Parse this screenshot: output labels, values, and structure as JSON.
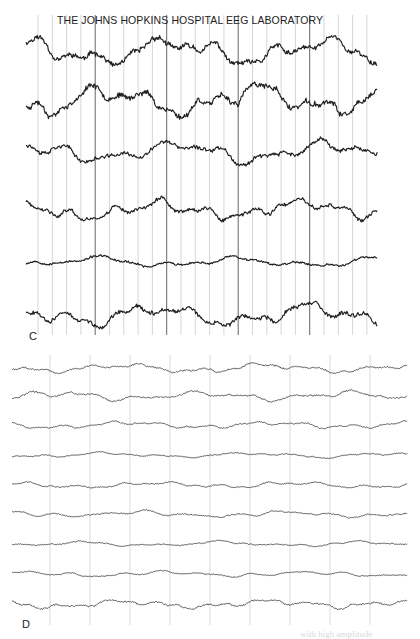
{
  "figure": {
    "header": "THE JOHNS HOPKINS HOSPITAL EEG LABORATORY",
    "caption_fragment": "with high amplitude"
  },
  "panels": [
    {
      "id": "C",
      "label": "C",
      "x_start": 26,
      "x_end": 378,
      "grid": {
        "x_first": 38,
        "spacing": 14.3,
        "x_last": 370,
        "y_top": 15,
        "y_bottom": 335,
        "dark_every": 5,
        "dark_offset": 4,
        "light_color": "#b8b8b8",
        "dark_color": "#555555"
      },
      "trace_color": "#1e1e1e",
      "trace_width": 1.15,
      "channels": [
        {
          "baseline": 52,
          "amplitude": 16,
          "seed": 11
        },
        {
          "baseline": 100,
          "amplitude": 17,
          "seed": 23
        },
        {
          "baseline": 152,
          "amplitude": 12,
          "seed": 37
        },
        {
          "baseline": 210,
          "amplitude": 11,
          "seed": 41
        },
        {
          "baseline": 262,
          "amplitude": 6,
          "seed": 53
        },
        {
          "baseline": 315,
          "amplitude": 12,
          "seed": 67
        }
      ]
    },
    {
      "id": "D",
      "label": "D",
      "x_start": 12,
      "x_end": 408,
      "grid": {
        "x_first": 50,
        "spacing": 40,
        "x_last": 372,
        "y_top": 355,
        "y_bottom": 625,
        "dark_every": 0,
        "dark_offset": 0,
        "light_color": "#c4c4c4",
        "dark_color": "#c4c4c4"
      },
      "trace_color": "#4a4a4a",
      "trace_width": 0.9,
      "channels": [
        {
          "baseline": 368,
          "amplitude": 5,
          "seed": 101
        },
        {
          "baseline": 396,
          "amplitude": 5,
          "seed": 113
        },
        {
          "baseline": 425,
          "amplitude": 4,
          "seed": 127
        },
        {
          "baseline": 455,
          "amplitude": 3,
          "seed": 131
        },
        {
          "baseline": 485,
          "amplitude": 3.5,
          "seed": 149
        },
        {
          "baseline": 514,
          "amplitude": 3.5,
          "seed": 151
        },
        {
          "baseline": 544,
          "amplitude": 3,
          "seed": 163
        },
        {
          "baseline": 574,
          "amplitude": 3,
          "seed": 173
        },
        {
          "baseline": 604,
          "amplitude": 5,
          "seed": 181
        }
      ]
    }
  ]
}
